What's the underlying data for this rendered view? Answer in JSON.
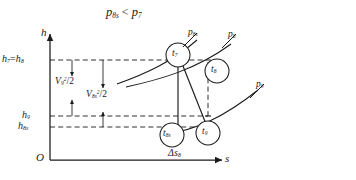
{
  "figure": {
    "type": "thermodynamic-h-s-diagram",
    "width": 356,
    "height": 180,
    "background": "#ffffff",
    "ink": "#1a1a1a"
  },
  "title": {
    "left_symbol": "p",
    "left_subscript": "8s",
    "relation": "<",
    "right_symbol": "p",
    "right_subscript": "7",
    "text": "p8s < p7"
  },
  "axes": {
    "y_name": "h",
    "x_name": "s",
    "origin": "O",
    "y_arrow": true,
    "x_arrow": true
  },
  "enthalpy_levels": [
    {
      "id": "h78",
      "symbol_a": "h",
      "subscript_a": "7",
      "equals": "=",
      "symbol_b": "h",
      "subscript_b": "8",
      "text": "h7 = h8",
      "y": 60
    },
    {
      "id": "h9",
      "symbol": "h",
      "subscript": "9",
      "text": "h9",
      "y": 116
    },
    {
      "id": "h8s",
      "symbol": "h",
      "subscript": "8s",
      "text": "h8s",
      "y": 127
    }
  ],
  "velocity_heads": [
    {
      "id": "v9",
      "symbol": "V",
      "subscript": "9",
      "exponent": "2",
      "divisor": "/2",
      "text": "V9^2/2",
      "arrow_x": 72,
      "arrow_top": 60,
      "arrow_bottom": 116
    },
    {
      "id": "v8s",
      "symbol": "V",
      "subscript": "8s",
      "exponent": "2",
      "divisor": "/2",
      "text": "V8s^2/2",
      "arrow_x": 103,
      "arrow_top": 60,
      "arrow_bottom": 127
    }
  ],
  "isobars": [
    {
      "id": "p8s",
      "symbol": "p",
      "subscript": "8s",
      "text": "p8s"
    },
    {
      "id": "p8",
      "symbol": "p",
      "subscript": "8",
      "text": "p8"
    },
    {
      "id": "p9",
      "symbol": "p",
      "subscript": "9",
      "text": "p9"
    }
  ],
  "state_points": [
    {
      "id": "t7",
      "symbol": "t",
      "subscript": "7",
      "text": "t7",
      "cx": 178,
      "cy": 55,
      "r": 12
    },
    {
      "id": "t8",
      "symbol": "t",
      "subscript": "8",
      "text": "t8",
      "cx": 217,
      "cy": 71,
      "r": 12
    },
    {
      "id": "t8s",
      "symbol": "t",
      "subscript": "8s",
      "text": "t8s",
      "cx": 172,
      "cy": 135,
      "r": 12
    },
    {
      "id": "t9",
      "symbol": "t",
      "subscript": "9",
      "text": "t9",
      "cx": 208,
      "cy": 133,
      "r": 12
    }
  ],
  "entropy_increase": {
    "symbol": "Δs",
    "subscript": "8",
    "text": "Δs8"
  }
}
